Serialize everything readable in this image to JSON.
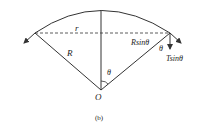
{
  "figure": {
    "caption": "(b)",
    "labels": {
      "radius_small": "r",
      "radius_big": "R",
      "horizontal_component": "Rsinθ",
      "angle_right": "θ",
      "tension_component": "Tsinθ",
      "angle_center": "θ",
      "origin": "O"
    }
  },
  "colors": {
    "stroke": "#333333",
    "background": "#ffffff"
  }
}
